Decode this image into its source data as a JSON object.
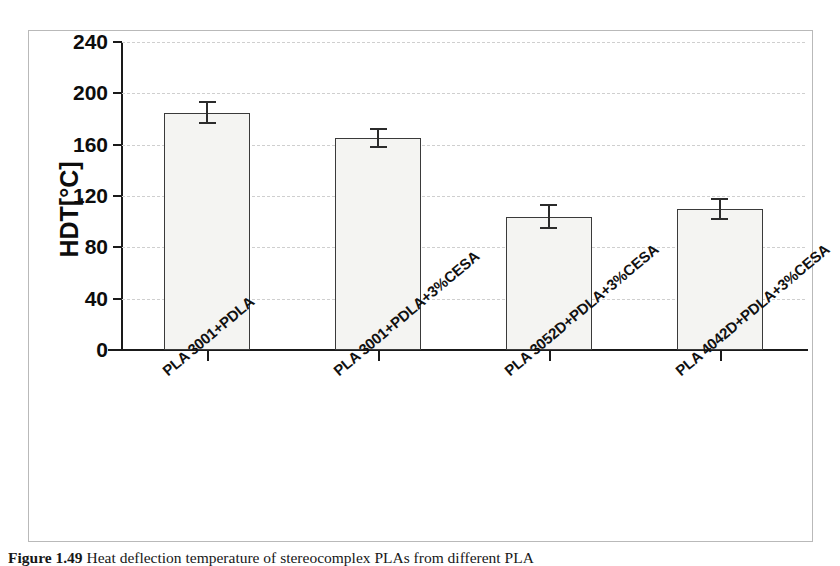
{
  "figure": {
    "caption_label": "Figure 1.49",
    "caption_text": "Heat deflection temperature of stereocomplex PLAs from different PLA"
  },
  "chart_data": {
    "type": "bar",
    "title": "",
    "xlabel": "",
    "ylabel": "HDT[°C]",
    "ylim": [
      0,
      240
    ],
    "yticks": [
      0,
      40,
      80,
      120,
      160,
      200,
      240
    ],
    "ytick_labels": [
      "0",
      "40",
      "80",
      "120",
      "160",
      "200",
      "240"
    ],
    "grid": true,
    "grid_axis": "y",
    "legend": false,
    "categories": [
      "PLA 3001+PDLA",
      "PLA 3001+PDLA+3%CESA",
      "PLA 3052D+PDLA+3%CESA",
      "PLA 4042D+PDLA+3%CESA"
    ],
    "values": [
      185,
      165,
      104,
      110
    ],
    "errors": [
      8,
      7,
      9,
      8
    ],
    "bar_color": "#f4f4f2",
    "bar_edge_color": "#3a3a3a",
    "error_color": "#2b2b2b",
    "grid_color": "#cfcfcf",
    "axis_color": "#1a1a1a"
  }
}
